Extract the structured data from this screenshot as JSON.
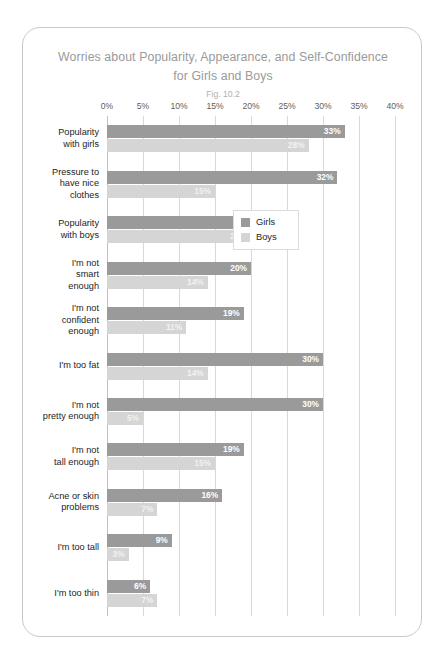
{
  "card": {
    "title": "Worries about Popularity, Appearance, and Self-Confidence for Girls and Boys",
    "title_line1": "Worries about Popularity, Appearance, and Self-Confidence",
    "title_line2": "for Girls and Boys",
    "subtitle": "Fig. 10.2"
  },
  "legend": {
    "items": [
      {
        "label": "Girls",
        "color": "#9a9a9a"
      },
      {
        "label": "Boys",
        "color": "#d5d5d5"
      }
    ]
  },
  "chart_data": {
    "type": "bar",
    "orientation": "horizontal",
    "title": "Worries about Popularity, Appearance, and Self-Confidence for Girls and Boys",
    "subtitle": "Fig. 10.2",
    "xlabel": "",
    "ylabel": "",
    "xlim": [
      0,
      40
    ],
    "xticks": [
      0,
      5,
      10,
      15,
      20,
      25,
      30,
      35,
      40
    ],
    "xtick_labels": [
      "0%",
      "5%",
      "10%",
      "15%",
      "20%",
      "25%",
      "30%",
      "35%",
      "40%"
    ],
    "grid": true,
    "legend_position": "middle-right",
    "value_suffix": "%",
    "categories": [
      "Popularity\nwith girls",
      "Pressure to\nhave nice\nclothes",
      "Popularity\nwith boys",
      "I'm not\nsmart\nenough",
      "I'm not\nconfident\nenough",
      "I'm too fat",
      "I'm not\npretty enough",
      "I'm not\ntall enough",
      "Acne or skin\nproblems",
      "I'm too tall",
      "I'm too thin"
    ],
    "series": [
      {
        "name": "Girls",
        "color": "#9a9a9a",
        "values": [
          33,
          32,
          25,
          20,
          19,
          30,
          30,
          19,
          16,
          9,
          6
        ],
        "labels": [
          "33%",
          "32%",
          "25%",
          "20%",
          "19%",
          "30%",
          "30%",
          "19%",
          "16%",
          "9%",
          "6%"
        ]
      },
      {
        "name": "Boys",
        "color": "#d5d5d5",
        "values": [
          28,
          15,
          20,
          14,
          11,
          14,
          5,
          15,
          7,
          3,
          7
        ],
        "labels": [
          "28%",
          "15%",
          "20%",
          "14%",
          "11%",
          "14%",
          "5%",
          "15%",
          "7%",
          "3%",
          "7%"
        ]
      }
    ]
  }
}
